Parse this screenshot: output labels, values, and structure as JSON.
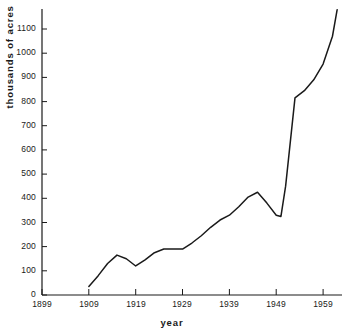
{
  "chart_data": {
    "type": "line",
    "title": "",
    "subtitle": "",
    "xlabel": "year",
    "ylabel": "thousands of acres",
    "grid": false,
    "legend": "none",
    "xlim": [
      1899,
      1963
    ],
    "ylim": [
      0,
      1180
    ],
    "xticks": [
      1899,
      1909,
      1919,
      1929,
      1939,
      1949,
      1959
    ],
    "xtick_labels": [
      "1899",
      "1909",
      "1919",
      "1929",
      "1939",
      "1949",
      "1959"
    ],
    "yticks": [
      0,
      100,
      200,
      300,
      400,
      500,
      600,
      700,
      800,
      900,
      1000,
      1100
    ],
    "ytick_labels": [
      "0",
      "100",
      "200",
      "300",
      "400",
      "500",
      "600",
      "700",
      "800",
      "900",
      "1000",
      "1100"
    ],
    "series": [
      {
        "name": "acres",
        "color": "#1a1a1a",
        "x": [
          1909,
          1911,
          1913,
          1915,
          1917,
          1919,
          1921,
          1923,
          1925,
          1927,
          1929,
          1931,
          1933,
          1935,
          1937,
          1939,
          1941,
          1943,
          1945,
          1947,
          1949,
          1950,
          1951,
          1953,
          1955,
          1957,
          1959,
          1961,
          1962
        ],
        "y": [
          35,
          80,
          130,
          165,
          150,
          120,
          145,
          175,
          190,
          190,
          190,
          215,
          245,
          280,
          310,
          330,
          365,
          405,
          425,
          380,
          330,
          325,
          450,
          815,
          845,
          890,
          955,
          1070,
          1180
        ]
      }
    ]
  },
  "axes": {
    "x_axis_title": "year",
    "y_axis_title": "thousands of acres"
  }
}
